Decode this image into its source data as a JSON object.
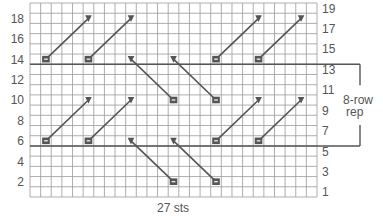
{
  "chart_title": "Knitting chart",
  "grid": {
    "columns": 27,
    "rows": 19,
    "x0": 30,
    "y0": 3,
    "col_w": 10.63,
    "row_h": 10.21,
    "line_color": "#999999",
    "heavy_line_color": "#555555"
  },
  "left_row_labels": [
    "2",
    "4",
    "6",
    "8",
    "10",
    "12",
    "14",
    "16",
    "18"
  ],
  "right_row_labels": [
    "1",
    "3",
    "5",
    "7",
    "9",
    "11",
    "13",
    "15",
    "17",
    "19"
  ],
  "bottom_label": "27 sts",
  "repeat": {
    "label_line1": "8-row",
    "label_line2": "rep",
    "start_row": 6,
    "end_row": 13
  },
  "symbols": {
    "purl_bar": {
      "name": "purl-bar-icon",
      "color": "#555555"
    },
    "triangle": {
      "name": "triangle-down-icon",
      "color": "#555555"
    }
  },
  "cables": [
    {
      "from": {
        "row": 14,
        "col": 2
      },
      "to": {
        "row": 18,
        "col": 6
      }
    },
    {
      "from": {
        "row": 14,
        "col": 6
      },
      "to": {
        "row": 18,
        "col": 10
      }
    },
    {
      "from": {
        "row": 14,
        "col": 18
      },
      "to": {
        "row": 18,
        "col": 22
      }
    },
    {
      "from": {
        "row": 14,
        "col": 22
      },
      "to": {
        "row": 18,
        "col": 26
      }
    },
    {
      "from": {
        "row": 10,
        "col": 14
      },
      "to": {
        "row": 14,
        "col": 10
      }
    },
    {
      "from": {
        "row": 10,
        "col": 18
      },
      "to": {
        "row": 14,
        "col": 14
      }
    },
    {
      "from": {
        "row": 6,
        "col": 2
      },
      "to": {
        "row": 10,
        "col": 6
      }
    },
    {
      "from": {
        "row": 6,
        "col": 6
      },
      "to": {
        "row": 10,
        "col": 10
      }
    },
    {
      "from": {
        "row": 6,
        "col": 18
      },
      "to": {
        "row": 10,
        "col": 22
      }
    },
    {
      "from": {
        "row": 6,
        "col": 22
      },
      "to": {
        "row": 10,
        "col": 26
      }
    },
    {
      "from": {
        "row": 2,
        "col": 14
      },
      "to": {
        "row": 6,
        "col": 10
      }
    },
    {
      "from": {
        "row": 2,
        "col": 18
      },
      "to": {
        "row": 6,
        "col": 14
      }
    }
  ]
}
